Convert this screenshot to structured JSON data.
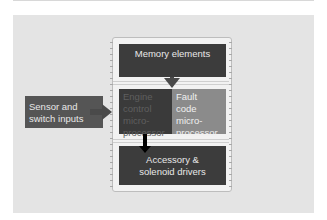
{
  "diagram": {
    "memory": {
      "label": "Memory elements"
    },
    "engine_control": {
      "label_lines": [
        "Engine",
        "control",
        "micro-",
        "processor"
      ]
    },
    "fault_code": {
      "label_lines": [
        "Fault",
        "code",
        "micro-",
        "processor"
      ]
    },
    "accessory": {
      "label_lines": [
        "Accessory &",
        "solenoid drivers"
      ]
    },
    "sensor": {
      "label_lines": [
        "Sensor and",
        "switch inputs"
      ]
    },
    "colors": {
      "panel": "#e4e4e4",
      "dark_block": "#3c3c3c",
      "fault_block": "#8b8b8b",
      "sensor_block": "#555555",
      "arrow_gray": "#4a4a4a",
      "arrow_black": "#000000"
    },
    "arrows": [
      {
        "from": "memory",
        "to": "fault_code"
      },
      {
        "from": "sensor",
        "to": "engine_control"
      },
      {
        "from": "engine_control",
        "to": "accessory"
      }
    ]
  }
}
